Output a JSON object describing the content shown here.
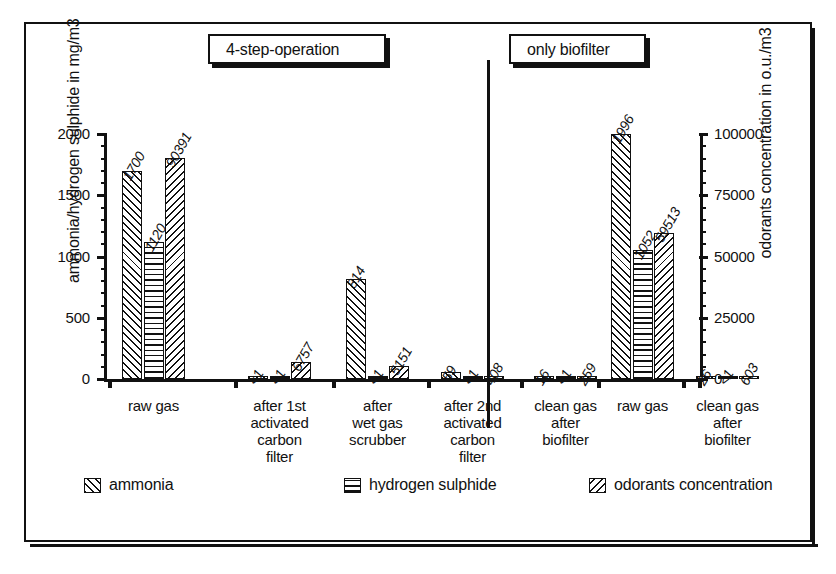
{
  "chart_data": {
    "type": "bar",
    "title": "",
    "ylabel": "ammonia/hydrogen sulphide in mg/m3",
    "y2label": "odorants concentration in o.u./m3",
    "xlabel": "",
    "ylim": [
      0,
      2000
    ],
    "y2lim": [
      0,
      100000
    ],
    "yticks": [
      "0",
      "500",
      "1000",
      "1500",
      "2000"
    ],
    "y2ticks": [
      "0",
      "25000",
      "50000",
      "75000",
      "100000"
    ],
    "grid": false,
    "legend_position": "bottom",
    "sections": [
      {
        "label": "4-step-operation"
      },
      {
        "label": "only biofilter"
      }
    ],
    "categories": [
      "raw gas",
      "after 1st activated carbon filter",
      "after wet gas scrubber",
      "after 2nd activated carbon filter",
      "clean gas after biofilter",
      "raw gas",
      "clean gas after biofilter"
    ],
    "category_lines": [
      [
        "raw gas"
      ],
      [
        "after 1st",
        "activated",
        "carbon",
        "filter"
      ],
      [
        "after",
        "wet gas",
        "scrubber"
      ],
      [
        "after 2nd",
        "activated",
        "carbon",
        "filter"
      ],
      [
        "clean gas",
        "after",
        "biofilter"
      ],
      [
        "raw gas"
      ],
      [
        "clean gas",
        "after",
        "biofilter"
      ]
    ],
    "series": [
      {
        "name": "ammonia",
        "unit": "mg/m3",
        "axis": "left",
        "pattern": "hatch-fwd",
        "values": [
          1700,
          1,
          814,
          59,
          16,
          1996,
          26
        ],
        "labels": [
          "1700",
          "<1",
          "814",
          "59",
          "16",
          "1996",
          "26"
        ]
      },
      {
        "name": "hydrogen sulphide",
        "unit": "mg/m3",
        "axis": "left",
        "pattern": "hatch-horiz",
        "values": [
          1120,
          1,
          1,
          1,
          1,
          1052,
          1
        ],
        "labels": [
          "1120",
          "<1",
          "<1",
          "<1",
          "<1",
          "1052",
          "<1"
        ]
      },
      {
        "name": "odorants concentration",
        "unit": "o.u./m3",
        "axis": "right",
        "pattern": "hatch-back",
        "values": [
          90391,
          6757,
          5151,
          408,
          259,
          59513,
          603
        ],
        "labels": [
          "90391",
          "6757",
          "5151",
          "408",
          "259",
          "59513",
          "603"
        ]
      }
    ]
  },
  "legend": {
    "items": [
      {
        "label": "ammonia",
        "pattern": "hatch-fwd"
      },
      {
        "label": "hydrogen sulphide",
        "pattern": "hatch-horiz"
      },
      {
        "label": "odorants concentration",
        "pattern": "hatch-back"
      }
    ]
  }
}
